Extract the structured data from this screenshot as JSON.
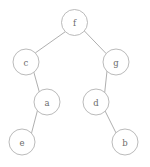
{
  "figure": {
    "type": "binary-tree-diagram",
    "background_color": "#ffffff",
    "node_fill_color": "#ffffff",
    "node_stroke_color": "#a8a8a8",
    "edge_color": "#9a9a9a",
    "label_color": "#6b6b6b",
    "node_radius": 13
  },
  "nodes": [
    {
      "id": "f",
      "label": "f",
      "cx": 74.5,
      "cy": 22.5,
      "r": 13
    },
    {
      "id": "c",
      "label": "c",
      "cx": 26,
      "cy": 62,
      "r": 13
    },
    {
      "id": "g",
      "label": "g",
      "cx": 116,
      "cy": 62,
      "r": 13
    },
    {
      "id": "a",
      "label": "a",
      "cx": 47,
      "cy": 102,
      "r": 13
    },
    {
      "id": "d",
      "label": "d",
      "cx": 96,
      "cy": 102,
      "r": 13
    },
    {
      "id": "e",
      "label": "e",
      "cx": 22,
      "cy": 142,
      "r": 13
    },
    {
      "id": "b",
      "label": "b",
      "cx": 125,
      "cy": 142,
      "r": 13
    }
  ],
  "edges": [
    {
      "from": "f",
      "to": "c",
      "side": "left",
      "x1": 65.0,
      "y1": 31.9,
      "x2": 35.6,
      "y2": 52.7
    },
    {
      "from": "f",
      "to": "g",
      "side": "right",
      "x1": 84.6,
      "y1": 31.2,
      "x2": 106.0,
      "y2": 53.4
    },
    {
      "from": "c",
      "to": "a",
      "side": "right",
      "x1": 33.9,
      "y1": 72.4,
      "x2": 39.2,
      "y2": 91.6
    },
    {
      "from": "a",
      "to": "e",
      "side": "left",
      "x1": 37.4,
      "y1": 110.7,
      "x2": 31.5,
      "y2": 133.2
    },
    {
      "from": "g",
      "to": "d",
      "side": "left",
      "x1": 107.0,
      "y1": 71.1,
      "x2": 104.7,
      "y2": 92.5
    },
    {
      "from": "d",
      "to": "b",
      "side": "right",
      "x1": 105.2,
      "y1": 111.2,
      "x2": 115.9,
      "y2": 132.7
    }
  ],
  "tree_structure": {
    "root": "f",
    "relations": [
      {
        "parent": "f",
        "left_child": "c",
        "right_child": "g"
      },
      {
        "parent": "c",
        "left_child": null,
        "right_child": "a"
      },
      {
        "parent": "a",
        "left_child": "e",
        "right_child": null
      },
      {
        "parent": "g",
        "left_child": "d",
        "right_child": null
      },
      {
        "parent": "d",
        "left_child": null,
        "right_child": "b"
      }
    ],
    "leaves": [
      "e",
      "b"
    ]
  }
}
